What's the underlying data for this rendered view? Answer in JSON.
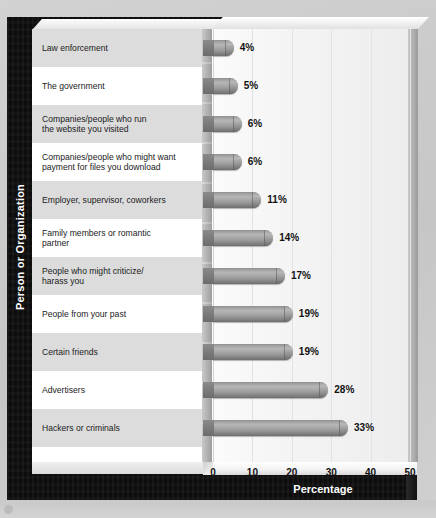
{
  "chart_data": {
    "type": "bar",
    "orientation": "horizontal",
    "title": "",
    "xlabel": "Percentage",
    "ylabel": "Person or Organization",
    "xlim": [
      0,
      55
    ],
    "xticks": [
      0,
      10,
      20,
      30,
      40,
      50
    ],
    "xtick_labels": [
      "0",
      "10",
      "20",
      "30",
      "40",
      "50"
    ],
    "grid": true,
    "legend": false,
    "categories": [
      "Law enforcement",
      "The government",
      "Companies/people who run\nthe website you visited",
      "Companies/people who might want\npayment for files you download",
      "Employer, supervisor, coworkers",
      "Family members or romantic\npartner",
      "People who might criticize/\nharass you",
      "People from your past",
      "Certain friends",
      "Advertisers",
      "Hackers or criminals"
    ],
    "values": [
      4,
      5,
      6,
      6,
      11,
      14,
      17,
      19,
      19,
      28,
      33
    ],
    "value_labels": [
      "4%",
      "5%",
      "6%",
      "6%",
      "11%",
      "14%",
      "17%",
      "19%",
      "19%",
      "28%",
      "33%"
    ],
    "bar_color": "#9a9a9a",
    "frame_color": "#0d0d0d",
    "panel_color": "#ffffff",
    "alt_row_color": "#dcdcdc",
    "background_color": "#cdcdcd"
  }
}
